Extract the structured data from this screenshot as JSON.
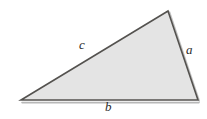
{
  "figure": {
    "name": "scalene-triangle",
    "background_color": "#ffffff",
    "fill_color": "#e4e4e4",
    "stroke_color": "#54524f",
    "shadow_color": "#b8b8b8",
    "stroke_width": 1.6,
    "vertices": {
      "bottom_left": {
        "x": 21,
        "y": 100
      },
      "bottom_right": {
        "x": 198,
        "y": 100
      },
      "apex": {
        "x": 168,
        "y": 11
      }
    },
    "labels": [
      {
        "id": "c",
        "text": "c",
        "side": "upper-left",
        "x": 79,
        "y": 38
      },
      {
        "id": "a",
        "text": "a",
        "side": "right",
        "x": 186,
        "y": 43
      },
      {
        "id": "b",
        "text": "b",
        "side": "bottom",
        "x": 105,
        "y": 100
      }
    ]
  }
}
